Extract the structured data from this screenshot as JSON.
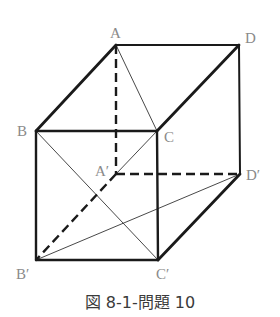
{
  "figure": {
    "caption": "図 8-1-問題 10",
    "type": "cube-perspective",
    "vertices": {
      "A": {
        "label": "A",
        "x": 116,
        "y": 45
      },
      "D": {
        "label": "D",
        "x": 239,
        "y": 45
      },
      "B": {
        "label": "B",
        "x": 36,
        "y": 131
      },
      "C": {
        "label": "C",
        "x": 157,
        "y": 131
      },
      "A2": {
        "label": "A′",
        "x": 116,
        "y": 174
      },
      "D2": {
        "label": "D′",
        "x": 240,
        "y": 174
      },
      "B2": {
        "label": "B′",
        "x": 36,
        "y": 260
      },
      "C2": {
        "label": "C′",
        "x": 158,
        "y": 260
      }
    },
    "edges_solid_thick": [
      "A-B",
      "A-D",
      "C-D",
      "B-C",
      "B-B′",
      "C-C′",
      "B′-C′",
      "C′-D′",
      "D-D′"
    ],
    "edges_dashed": [
      "A-A′",
      "A′-D′",
      "A′-B′"
    ],
    "diagonals_thin": [
      "A-C",
      "B-C′",
      "C-A′",
      "B′-D′"
    ],
    "colors": {
      "line": "#1a1a1a",
      "label": "#8a8a8a",
      "caption": "#3a3a3a"
    }
  }
}
